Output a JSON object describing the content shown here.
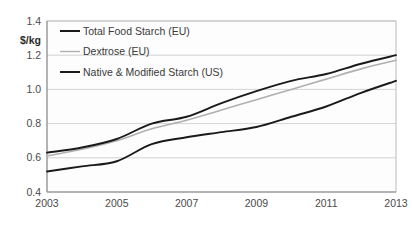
{
  "chart_data": {
    "type": "line",
    "title": "",
    "xlabel": "",
    "ylabel": "$/kg",
    "ylim": [
      0.4,
      1.4
    ],
    "xlim": [
      2003,
      2013
    ],
    "grid": true,
    "legend_position": "top-left",
    "y_ticks": [
      "1.4",
      "1.2",
      "1.0",
      "0.8",
      "0.6",
      "0.4"
    ],
    "y_tick_values": [
      1.4,
      1.2,
      1.0,
      0.8,
      0.6,
      0.4
    ],
    "x_ticks": [
      "2003",
      "2005",
      "2007",
      "2009",
      "2011",
      "2013"
    ],
    "x_tick_values": [
      2003,
      2005,
      2007,
      2009,
      2011,
      2013
    ],
    "x": [
      2003,
      2004,
      2005,
      2006,
      2007,
      2008,
      2009,
      2010,
      2011,
      2012,
      2013
    ],
    "series": [
      {
        "name": "Total Food Starch (EU)",
        "color": "#1a1a1a",
        "width": 1.9,
        "values": [
          0.63,
          0.66,
          0.71,
          0.8,
          0.84,
          0.92,
          0.99,
          1.05,
          1.09,
          1.15,
          1.2
        ]
      },
      {
        "name": "Dextrose (EU)",
        "color": "#b0b0b0",
        "width": 1.6,
        "values": [
          0.61,
          0.65,
          0.7,
          0.77,
          0.82,
          0.88,
          0.94,
          1.0,
          1.06,
          1.12,
          1.17
        ]
      },
      {
        "name": "Native & Modified Starch (US)",
        "color": "#1a1a1a",
        "width": 1.9,
        "values": [
          0.52,
          0.55,
          0.58,
          0.68,
          0.72,
          0.75,
          0.78,
          0.84,
          0.9,
          0.98,
          1.05
        ]
      }
    ]
  },
  "legend": {
    "items": [
      {
        "label": "Total Food Starch (EU)",
        "color": "#1a1a1a"
      },
      {
        "label": "Dextrose (EU)",
        "color": "#b0b0b0"
      },
      {
        "label": "Native & Modified Starch (US)",
        "color": "#1a1a1a"
      }
    ]
  },
  "axis": {
    "y_unit_label": "$/kg"
  }
}
